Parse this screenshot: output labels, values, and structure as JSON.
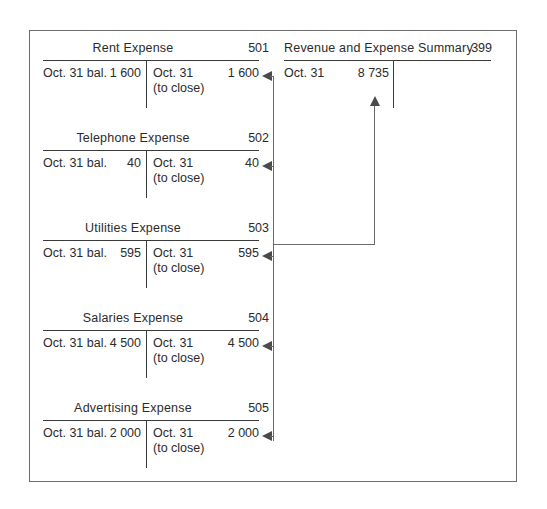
{
  "diagram": {
    "accounts": [
      {
        "name": "Rent Expense",
        "number": "501",
        "debit_label": "Oct. 31 bal.",
        "debit_amount": "1 600",
        "credit_label": "Oct. 31",
        "credit_sublabel": "(to close)",
        "credit_amount": "1 600"
      },
      {
        "name": "Telephone Expense",
        "number": "502",
        "debit_label": "Oct. 31 bal.",
        "debit_amount": "40",
        "credit_label": "Oct. 31",
        "credit_sublabel": "(to close)",
        "credit_amount": "40"
      },
      {
        "name": "Utilities Expense",
        "number": "503",
        "debit_label": "Oct. 31 bal.",
        "debit_amount": "595",
        "credit_label": "Oct. 31",
        "credit_sublabel": "(to close)",
        "credit_amount": "595"
      },
      {
        "name": "Salaries Expense",
        "number": "504",
        "debit_label": "Oct. 31 bal.",
        "debit_amount": "4 500",
        "credit_label": "Oct. 31",
        "credit_sublabel": "(to close)",
        "credit_amount": "4 500"
      },
      {
        "name": "Advertising Expense",
        "number": "505",
        "debit_label": "Oct. 31 bal.",
        "debit_amount": "2 000",
        "credit_label": "Oct. 31",
        "credit_sublabel": "(to close)",
        "credit_amount": "2 000"
      }
    ],
    "summary_account": {
      "name": "Revenue and Expense Summary",
      "number": "399",
      "debit_label": "Oct. 31",
      "debit_amount": "8 735"
    },
    "colors": {
      "text": "#2b2b2b",
      "rule": "#3a3a3a",
      "connector": "#6b6b6b",
      "frame": "#6e6e6e",
      "background": "#ffffff"
    }
  }
}
